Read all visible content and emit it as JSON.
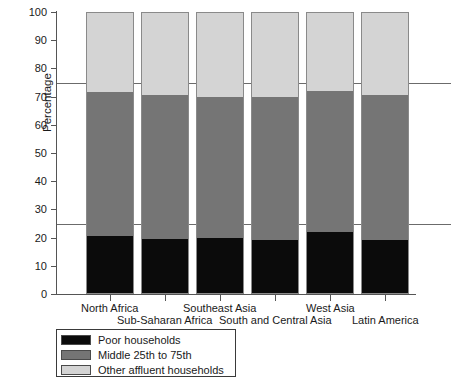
{
  "chart_data": {
    "type": "bar",
    "subtype": "stacked-bar-100-percent",
    "title": "",
    "xlabel": "",
    "ylabel": "Percentage",
    "ylim": [
      0,
      100
    ],
    "yticks": [
      0,
      10,
      20,
      30,
      40,
      50,
      60,
      70,
      80,
      90,
      100
    ],
    "ytick_labels": [
      "0",
      "10",
      "20",
      "30",
      "40",
      "50",
      "60",
      "70",
      "80",
      "90",
      "100"
    ],
    "grid": false,
    "reference_lines": [
      25,
      75
    ],
    "legend_position": "below-left",
    "categories": [
      "North Africa",
      "Sub-Saharan Africa",
      "Southeast Asia",
      "South and Central Asia",
      "West Asia",
      "Latin America"
    ],
    "series": [
      {
        "name": "Poor households",
        "color": "#0b0b0b",
        "values": [
          20.5,
          19.5,
          20.0,
          19.0,
          22.0,
          19.0
        ]
      },
      {
        "name": "Middle 25th to 75th",
        "color": "#757575",
        "values": [
          51.0,
          51.0,
          50.0,
          51.0,
          50.0,
          51.5
        ]
      },
      {
        "name": "Other affluent households",
        "color": "#d4d4d4",
        "values": [
          28.5,
          29.5,
          30.0,
          30.0,
          28.0,
          29.5
        ]
      }
    ],
    "stack_tops": {
      "poor": [
        20.5,
        19.5,
        20.0,
        19.0,
        22.0,
        19.0
      ],
      "middle": [
        71.5,
        70.5,
        70.0,
        70.0,
        72.0,
        70.5
      ],
      "other": [
        100,
        100,
        100,
        100,
        100,
        100
      ]
    }
  },
  "axis": {
    "y_title": "Percentage"
  },
  "legend": {
    "items": [
      {
        "label": "Poor households",
        "color": "#0b0b0b"
      },
      {
        "label": "Middle 25th to 75th",
        "color": "#757575"
      },
      {
        "label": "Other affluent households",
        "color": "#d4d4d4"
      }
    ]
  }
}
